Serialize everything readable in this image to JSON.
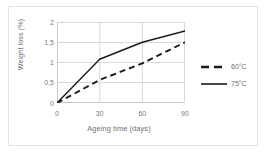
{
  "chart_data": {
    "type": "line",
    "title": "",
    "xlabel": "Ageing time (days)",
    "ylabel": "Weight loss (%)",
    "xlim": [
      0,
      90
    ],
    "ylim": [
      0,
      2
    ],
    "xticks": [
      "0",
      "30",
      "60",
      "90"
    ],
    "xtick_values": [
      0,
      30,
      60,
      90
    ],
    "yticks": [
      "0",
      "0,5",
      "1",
      "1,5",
      "2"
    ],
    "ytick_values": [
      0,
      0.5,
      1,
      1.5,
      2
    ],
    "grid": "horizontal-and-vertical",
    "legend_position": "right",
    "x": [
      0,
      30,
      60,
      90
    ],
    "series": [
      {
        "name": "60°C",
        "style": "dashed",
        "color": "#1a1a1a",
        "values": [
          0,
          0.57,
          0.98,
          1.5
        ]
      },
      {
        "name": "75°C",
        "style": "solid",
        "color": "#1a1a1a",
        "values": [
          0,
          1.08,
          1.5,
          1.78
        ]
      }
    ]
  },
  "legend": {
    "items": [
      {
        "label": "60°C",
        "style": "dashed"
      },
      {
        "label": "75°C",
        "style": "solid"
      }
    ]
  },
  "colors": {
    "axis_text": "#7a7a7a",
    "grid": "#d9d9d9",
    "line": "#1a1a1a",
    "frame": "#e3e3e3",
    "background": "#ffffff"
  }
}
